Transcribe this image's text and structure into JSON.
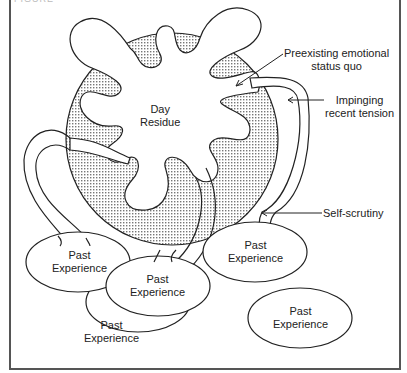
{
  "figure": {
    "caption": "FIGURE",
    "center_label": [
      "Day",
      "Residue"
    ],
    "annotations": [
      {
        "id": "preexisting",
        "lines": [
          "Preexisting emotional",
          "status quo"
        ]
      },
      {
        "id": "impinging",
        "lines": [
          "Impinging",
          "recent tension"
        ]
      },
      {
        "id": "self-scrutiny",
        "lines": [
          "Self-scrutiny"
        ]
      }
    ],
    "nodes": [
      {
        "id": "pe1",
        "lines": [
          "Past",
          "Experience"
        ]
      },
      {
        "id": "pe2",
        "lines": [
          "Past",
          "Experience"
        ]
      },
      {
        "id": "pe3",
        "lines": [
          "Past",
          "Experience"
        ]
      },
      {
        "id": "pe4",
        "lines": [
          "Past",
          "Experience"
        ]
      },
      {
        "id": "pe5",
        "lines": [
          "Past",
          "Experience"
        ]
      }
    ]
  }
}
